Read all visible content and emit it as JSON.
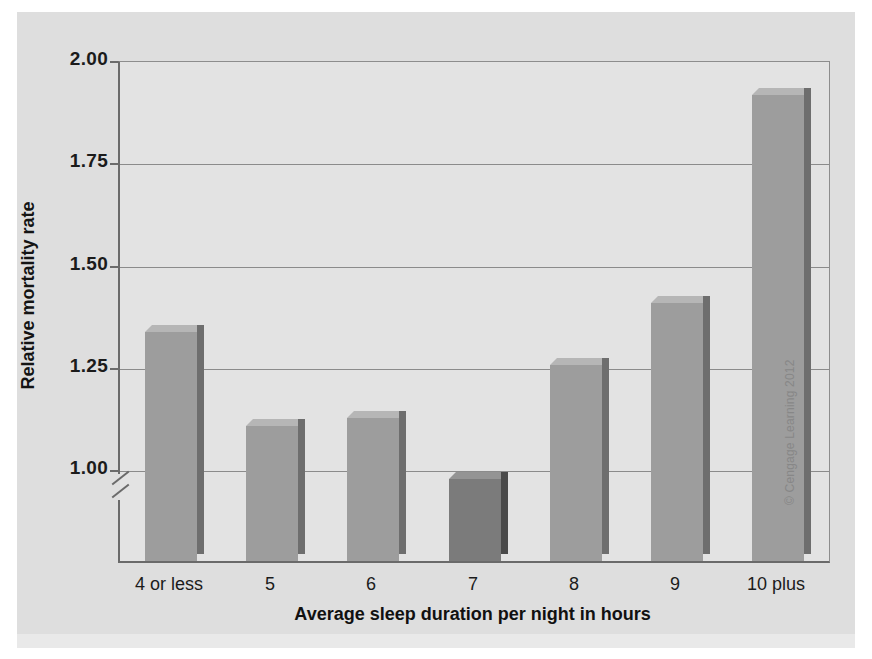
{
  "figure": {
    "background_color": "#dedede",
    "plot_background_color": "#e3e3e3",
    "attribution": "© Cengage Learning 2012"
  },
  "chart_data": {
    "type": "bar",
    "title": "",
    "xlabel": "Average sleep duration per night in hours",
    "ylabel": "Relative mortality rate",
    "categories": [
      "4 or less",
      "5",
      "6",
      "7",
      "8",
      "9",
      "10 plus"
    ],
    "values": [
      1.34,
      1.11,
      1.13,
      0.98,
      1.26,
      1.41,
      1.92
    ],
    "highlight_index": 3,
    "ylim": [
      0.78,
      2.0
    ],
    "yticks": [
      1.0,
      1.25,
      1.5,
      1.75,
      2.0
    ],
    "ytick_labels": [
      "1.00",
      "1.25",
      "1.50",
      "1.75",
      "2.00"
    ],
    "grid": true,
    "legend": "none",
    "axis_break": true,
    "bar_color": "#9d9d9d",
    "highlight_bar_color": "#7b7b7b",
    "gridline_color": "#8b8b8b",
    "axis_color": "#6a6a6a"
  },
  "bars": [
    {
      "label": "4 or less",
      "value": 1.34
    },
    {
      "label": "5",
      "value": 1.11
    },
    {
      "label": "6",
      "value": 1.13
    },
    {
      "label": "7",
      "value": 0.98
    },
    {
      "label": "8",
      "value": 1.26
    },
    {
      "label": "9",
      "value": 1.41
    },
    {
      "label": "10 plus",
      "value": 1.92
    }
  ],
  "yticks": [
    {
      "label": "2.00",
      "value": 2.0
    },
    {
      "label": "1.75",
      "value": 1.75
    },
    {
      "label": "1.50",
      "value": 1.5
    },
    {
      "label": "1.25",
      "value": 1.25
    },
    {
      "label": "1.00",
      "value": 1.0
    }
  ]
}
